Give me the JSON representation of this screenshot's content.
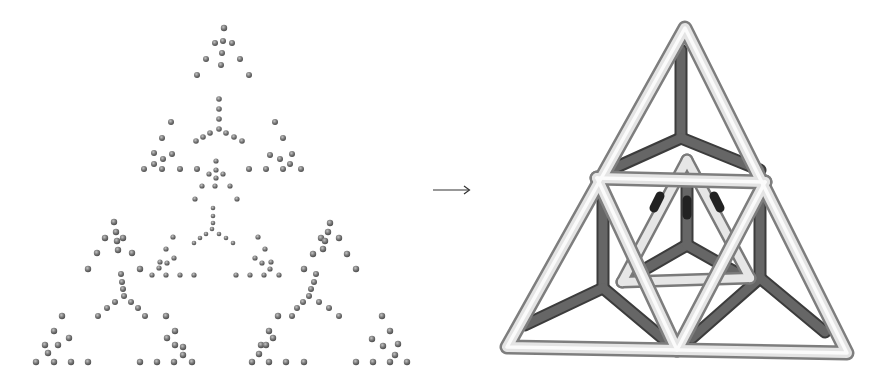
{
  "figure": {
    "left_panel": {
      "label": "sierpinski-dot-fractal",
      "dot_color": "#6e6e6e",
      "dot_highlight": "#b8b8b8",
      "dots": [
        [
          224,
          28,
          3.2
        ],
        [
          215,
          43,
          3
        ],
        [
          223,
          41,
          3
        ],
        [
          232,
          43,
          3
        ],
        [
          222,
          53,
          3
        ],
        [
          206,
          59,
          3
        ],
        [
          240,
          59,
          3
        ],
        [
          221,
          65,
          3
        ],
        [
          197,
          75,
          3
        ],
        [
          249,
          75,
          3
        ],
        [
          219,
          99,
          2.8
        ],
        [
          219,
          109,
          2.8
        ],
        [
          219,
          119,
          2.8
        ],
        [
          219,
          129,
          2.8
        ],
        [
          210,
          133,
          2.8
        ],
        [
          203,
          137,
          2.8
        ],
        [
          196,
          141,
          2.8
        ],
        [
          226,
          133,
          2.8
        ],
        [
          234,
          137,
          2.8
        ],
        [
          242,
          141,
          2.8
        ],
        [
          171,
          122,
          3
        ],
        [
          162,
          138,
          3
        ],
        [
          154,
          153,
          3
        ],
        [
          172,
          154,
          3
        ],
        [
          163,
          159,
          3
        ],
        [
          162,
          169,
          3
        ],
        [
          144,
          169,
          3
        ],
        [
          180,
          169,
          3
        ],
        [
          154,
          164,
          3
        ],
        [
          275,
          122,
          3
        ],
        [
          283,
          138,
          3
        ],
        [
          270,
          155,
          3
        ],
        [
          280,
          159,
          3
        ],
        [
          292,
          154,
          3
        ],
        [
          290,
          164,
          3
        ],
        [
          266,
          169,
          3
        ],
        [
          283,
          169,
          3
        ],
        [
          301,
          169,
          3
        ],
        [
          197,
          169,
          3
        ],
        [
          249,
          169,
          3
        ],
        [
          216,
          161,
          2.6
        ],
        [
          209,
          174,
          2.6
        ],
        [
          216,
          170,
          2.6
        ],
        [
          223,
          174,
          2.6
        ],
        [
          216,
          178,
          2.6
        ],
        [
          202,
          186,
          2.6
        ],
        [
          215,
          186,
          2.6
        ],
        [
          230,
          186,
          2.6
        ],
        [
          195,
          199,
          2.6
        ],
        [
          237,
          199,
          2.6
        ],
        [
          213,
          208,
          2.3
        ],
        [
          213,
          216,
          2.3
        ],
        [
          213,
          223,
          2.3
        ],
        [
          212,
          229,
          2.3
        ],
        [
          206,
          234,
          2.3
        ],
        [
          200,
          238,
          2.3
        ],
        [
          194,
          243,
          2.3
        ],
        [
          219,
          234,
          2.3
        ],
        [
          226,
          238,
          2.3
        ],
        [
          233,
          243,
          2.3
        ],
        [
          173,
          237,
          2.6
        ],
        [
          166,
          249,
          2.6
        ],
        [
          174,
          258,
          2.6
        ],
        [
          160,
          262,
          2.6
        ],
        [
          167,
          263,
          2.6
        ],
        [
          159,
          268,
          2.6
        ],
        [
          152,
          275,
          2.6
        ],
        [
          166,
          275,
          2.6
        ],
        [
          180,
          275,
          2.6
        ],
        [
          194,
          275,
          2.6
        ],
        [
          258,
          237,
          2.6
        ],
        [
          265,
          249,
          2.6
        ],
        [
          255,
          258,
          2.6
        ],
        [
          262,
          263,
          2.6
        ],
        [
          271,
          262,
          2.6
        ],
        [
          270,
          269,
          2.6
        ],
        [
          236,
          275,
          2.6
        ],
        [
          250,
          275,
          2.6
        ],
        [
          264,
          275,
          2.6
        ],
        [
          279,
          275,
          2.6
        ],
        [
          114,
          222,
          3.2
        ],
        [
          116,
          232,
          3.2
        ],
        [
          105,
          238,
          3.2
        ],
        [
          117,
          241,
          3.2
        ],
        [
          123,
          238,
          3.2
        ],
        [
          118,
          250,
          3.2
        ],
        [
          97,
          253,
          3.2
        ],
        [
          132,
          253,
          3.2
        ],
        [
          88,
          269,
          3.2
        ],
        [
          140,
          269,
          3.2
        ],
        [
          121,
          274,
          3
        ],
        [
          122,
          282,
          3
        ],
        [
          123,
          289,
          3
        ],
        [
          124,
          296,
          3
        ],
        [
          115,
          302,
          3
        ],
        [
          107,
          308,
          3
        ],
        [
          98,
          316,
          3
        ],
        [
          131,
          302,
          3
        ],
        [
          138,
          308,
          3
        ],
        [
          145,
          316,
          3
        ],
        [
          62,
          316,
          3.2
        ],
        [
          54,
          331,
          3.2
        ],
        [
          69,
          338,
          3.2
        ],
        [
          45,
          345,
          3.2
        ],
        [
          58,
          345,
          3.2
        ],
        [
          48,
          353,
          3.2
        ],
        [
          36,
          362,
          3.2
        ],
        [
          54,
          362,
          3.2
        ],
        [
          71,
          362,
          3.2
        ],
        [
          88,
          362,
          3.2
        ],
        [
          166,
          316,
          3.2
        ],
        [
          175,
          331,
          3.2
        ],
        [
          167,
          338,
          3.2
        ],
        [
          175,
          345,
          3.2
        ],
        [
          183,
          347,
          3.2
        ],
        [
          183,
          355,
          3.2
        ],
        [
          140,
          362,
          3.2
        ],
        [
          157,
          362,
          3.2
        ],
        [
          174,
          362,
          3.2
        ],
        [
          192,
          362,
          3.2
        ],
        [
          330,
          223,
          3.2
        ],
        [
          328,
          232,
          3.2
        ],
        [
          321,
          238,
          3.2
        ],
        [
          325,
          241,
          3.2
        ],
        [
          339,
          238,
          3.2
        ],
        [
          323,
          249,
          3.2
        ],
        [
          313,
          254,
          3.2
        ],
        [
          347,
          254,
          3.2
        ],
        [
          304,
          269,
          3.2
        ],
        [
          356,
          269,
          3.2
        ],
        [
          316,
          274,
          3
        ],
        [
          314,
          282,
          3
        ],
        [
          311,
          289,
          3
        ],
        [
          309,
          296,
          3
        ],
        [
          303,
          302,
          3
        ],
        [
          297,
          308,
          3
        ],
        [
          292,
          316,
          3
        ],
        [
          319,
          302,
          3
        ],
        [
          329,
          308,
          3
        ],
        [
          339,
          316,
          3
        ],
        [
          278,
          316,
          3.2
        ],
        [
          269,
          331,
          3.2
        ],
        [
          273,
          338,
          3.2
        ],
        [
          261,
          345,
          3.2
        ],
        [
          266,
          345,
          3.2
        ],
        [
          259,
          354,
          3.2
        ],
        [
          252,
          362,
          3.2
        ],
        [
          269,
          362,
          3.2
        ],
        [
          286,
          362,
          3.2
        ],
        [
          304,
          362,
          3.2
        ],
        [
          382,
          316,
          3.2
        ],
        [
          390,
          331,
          3.2
        ],
        [
          372,
          339,
          3.2
        ],
        [
          383,
          346,
          3.2
        ],
        [
          398,
          344,
          3.2
        ],
        [
          395,
          355,
          3.2
        ],
        [
          356,
          362,
          3.2
        ],
        [
          373,
          362,
          3.2
        ],
        [
          390,
          362,
          3.2
        ],
        [
          407,
          362,
          3.2
        ]
      ]
    },
    "arrow": {
      "symbol": "⟶",
      "color": "#333333"
    },
    "right_panel": {
      "label": "tetrahedral-wireframe-render",
      "light_tube_color": "#d8d8d8",
      "light_tube_edge": "#8a8a8a",
      "dark_tube_color": "#5e5e5e",
      "dark_tube_edge": "#3a3a3a"
    }
  }
}
